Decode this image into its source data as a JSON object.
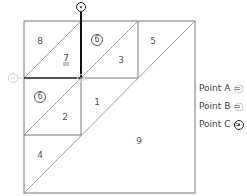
{
  "diagram": {
    "outer_square": {
      "x1": 24,
      "y1": 21,
      "x2": 195,
      "y2": 193
    },
    "regions": [
      {
        "id": "r8",
        "label": "8",
        "style": "plain",
        "x": 40,
        "y": 41
      },
      {
        "id": "r7",
        "label": "7",
        "style": "double-underline",
        "x": 66,
        "y": 58
      },
      {
        "id": "r6a",
        "label": "6",
        "style": "circled",
        "x": 97,
        "y": 40
      },
      {
        "id": "r3",
        "label": "3",
        "style": "plain",
        "x": 121,
        "y": 60
      },
      {
        "id": "r5",
        "label": "5",
        "style": "plain",
        "x": 153,
        "y": 41
      },
      {
        "id": "r6b",
        "label": "6",
        "style": "circled",
        "x": 40,
        "y": 97
      },
      {
        "id": "r2",
        "label": "2",
        "style": "plain",
        "x": 65,
        "y": 117
      },
      {
        "id": "r1",
        "label": "1",
        "style": "plain",
        "x": 97,
        "y": 102
      },
      {
        "id": "r4",
        "label": "4",
        "style": "plain",
        "x": 40,
        "y": 155
      },
      {
        "id": "r9",
        "label": "9",
        "style": "plain",
        "x": 139,
        "y": 141
      }
    ],
    "points": [
      {
        "name": "Point A",
        "x": 13,
        "y": 78,
        "symbol": "double-dot-circle",
        "color": "#cccccc"
      },
      {
        "name": "Point B",
        "x": 81,
        "y": 78,
        "symbol": "dot-circle",
        "color": "#cccccc"
      },
      {
        "name": "Point C",
        "x": 81,
        "y": 7,
        "symbol": "dot-circle",
        "color": "#222222"
      }
    ]
  },
  "legend": {
    "items": [
      {
        "label": "Point A =",
        "symbol": "double-dot-circle"
      },
      {
        "label": "Point B =",
        "symbol": "dot-circle-light"
      },
      {
        "label": "Point C =",
        "symbol": "dot-circle-dark"
      }
    ]
  },
  "colors": {
    "line": "#666666",
    "thick_line": "#111111",
    "faint_marker": "#cccccc",
    "dark_marker": "#222222"
  }
}
